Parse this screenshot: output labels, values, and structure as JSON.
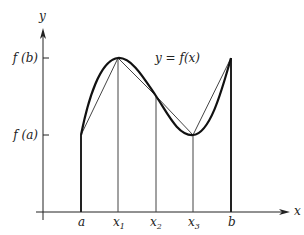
{
  "diagram": {
    "axes": {
      "x_label": "x",
      "y_label": "y"
    },
    "curve_label": "y = f(x)",
    "y_ticks": [
      {
        "id": "fb",
        "label": "f (b)"
      },
      {
        "id": "fa",
        "label": "f (a)"
      }
    ],
    "x_ticks": [
      {
        "id": "a",
        "label": "a",
        "sub": ""
      },
      {
        "id": "x1",
        "label": "x",
        "sub": "1"
      },
      {
        "id": "x2",
        "label": "x",
        "sub": "2"
      },
      {
        "id": "x3",
        "label": "x",
        "sub": "3"
      },
      {
        "id": "b",
        "label": "b",
        "sub": ""
      }
    ],
    "colors": {
      "ink": "#222222",
      "thin": "#444444"
    }
  }
}
